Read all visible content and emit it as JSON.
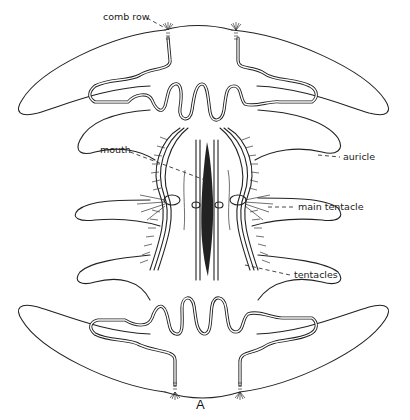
{
  "figure": {
    "panel_letter": "A",
    "labels": [
      {
        "id": "comb-row",
        "text": "comb row"
      },
      {
        "id": "mouth",
        "text": "mouth"
      },
      {
        "id": "auricle",
        "text": "auricle"
      },
      {
        "id": "main-tentacle",
        "text": "main tentacle"
      },
      {
        "id": "tentacles",
        "text": "tentacles"
      }
    ]
  }
}
